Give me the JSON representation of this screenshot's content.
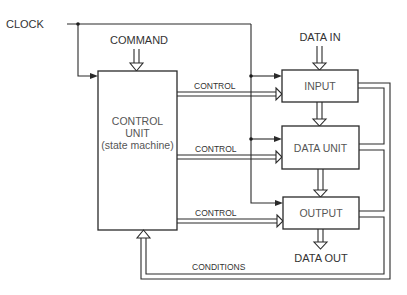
{
  "diagram": {
    "signals": {
      "clock": "CLOCK",
      "command": "COMMAND",
      "data_in": "DATA IN",
      "data_out": "DATA OUT",
      "conditions": "CONDITIONS"
    },
    "control_unit": {
      "line1": "CONTROL",
      "line2": "UNIT",
      "line3": "(state machine)"
    },
    "blocks": [
      {
        "id": "input",
        "label": "INPUT"
      },
      {
        "id": "data-unit",
        "label": "DATA UNIT"
      },
      {
        "id": "output",
        "label": "OUTPUT"
      }
    ],
    "control_buses": [
      {
        "label": "CONTROL",
        "target": "INPUT"
      },
      {
        "label": "CONTROL",
        "target": "DATA UNIT"
      },
      {
        "label": "CONTROL",
        "target": "OUTPUT"
      }
    ],
    "colors": {
      "line": "#2a2a2a",
      "text": "#333333",
      "background": "#ffffff"
    }
  }
}
